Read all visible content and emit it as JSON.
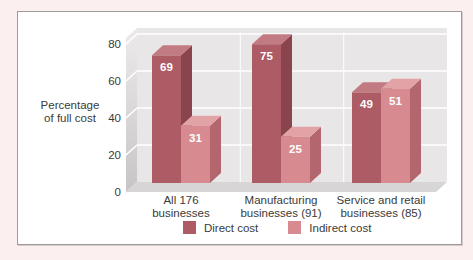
{
  "page": {
    "background_color": "#fcefef",
    "frame_border_color": "#9c9a9a",
    "panel_color": "#ffffff"
  },
  "chart_data": {
    "type": "bar",
    "projection": "3d",
    "title": "",
    "ylabel": "Percentage\nof full cost",
    "xlabel": "",
    "ylim": [
      0,
      80
    ],
    "yticks": [
      0,
      20,
      40,
      60,
      80
    ],
    "grid": true,
    "legend_position": "bottom",
    "categories": [
      "All 176\nbusinesses",
      "Manufacturing\nbusinesses (91)",
      "Service and retail\nbusinesses (85)"
    ],
    "series": [
      {
        "name": "Direct cost",
        "values": [
          69,
          75,
          49
        ],
        "color": "#ad5b64",
        "color_side": "#8a444d",
        "color_top": "#c27b82"
      },
      {
        "name": "Indirect cost",
        "values": [
          31,
          25,
          51
        ],
        "color": "#d78b90",
        "color_side": "#b3666e",
        "color_top": "#e1a3a6"
      }
    ],
    "value_labels": true,
    "value_label_color": "#ffffff",
    "wall_color": "#e9e6e7",
    "floor_color": "#d8d5d6",
    "side_wall_dark": "#c9c5c6",
    "side_wall_light": "#edeaea",
    "gridline_color": "#ffffff"
  }
}
